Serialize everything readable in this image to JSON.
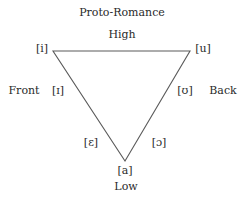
{
  "title": "Proto-Romance",
  "labels": {
    "high": "High",
    "low": "Low",
    "front": "Front",
    "back": "Back"
  },
  "vowels": {
    "i": "[i]",
    "u": "[u]",
    "near_close_front": "[ɪ]",
    "near_close_back": "[ʊ]",
    "open_mid_front": "[ɛ]",
    "open_mid_back": "[ɔ]",
    "a": "[a]"
  },
  "triangle": {
    "vertices": [
      [
        53,
        51
      ],
      [
        190,
        51
      ],
      [
        125,
        161
      ]
    ],
    "stroke": "#555555"
  }
}
